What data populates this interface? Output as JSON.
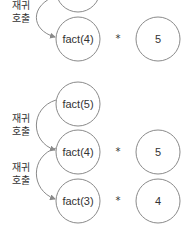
{
  "diagram": {
    "colors": {
      "stroke": "#8a8a8a",
      "text": "#333333",
      "background": "#ffffff"
    },
    "top_section": {
      "partial_node": {
        "label": ""
      },
      "call_label_line1": "재귀",
      "call_label_line2": "호출",
      "row": {
        "call": "fact(4)",
        "operator": "*",
        "value": "5"
      }
    },
    "bottom_section": {
      "root": {
        "call": "fact(5)"
      },
      "calls": [
        {
          "label_line1": "재귀",
          "label_line2": "호출"
        },
        {
          "label_line1": "재귀",
          "label_line2": "호출"
        }
      ],
      "rows": [
        {
          "call": "fact(4)",
          "operator": "*",
          "value": "5"
        },
        {
          "call": "fact(3)",
          "operator": "*",
          "value": "4"
        }
      ]
    }
  }
}
